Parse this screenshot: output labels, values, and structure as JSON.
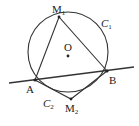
{
  "labels": {
    "M1": "M",
    "M1_sub": "1",
    "M2": "M",
    "M2_sub": "2",
    "A": "A",
    "B": "B",
    "O": "O",
    "C1": "C",
    "C1_sub": "1",
    "C2": "C",
    "C2_sub": "2"
  },
  "colors": {
    "stroke": "#333333",
    "background": "#ffffff"
  }
}
